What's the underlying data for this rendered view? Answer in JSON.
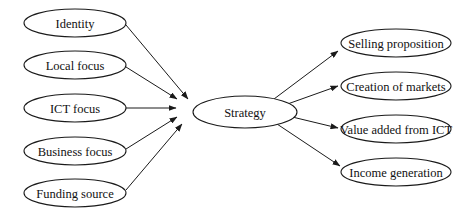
{
  "diagram": {
    "center": {
      "id": "strategy",
      "label": "Strategy",
      "cx": 245,
      "cy": 112,
      "rx": 52,
      "ry": 16
    },
    "inputs": [
      {
        "id": "identity",
        "label": "Identity",
        "cx": 75,
        "cy": 23,
        "rx": 51,
        "ry": 14
      },
      {
        "id": "local-focus",
        "label": "Local focus",
        "cx": 75,
        "cy": 65,
        "rx": 51,
        "ry": 14
      },
      {
        "id": "ict-focus",
        "label": "ICT focus",
        "cx": 75,
        "cy": 108,
        "rx": 51,
        "ry": 14
      },
      {
        "id": "business-focus",
        "label": "Business focus",
        "cx": 75,
        "cy": 151,
        "rx": 51,
        "ry": 14
      },
      {
        "id": "funding-source",
        "label": "Funding source",
        "cx": 75,
        "cy": 193,
        "rx": 51,
        "ry": 14
      }
    ],
    "outputs": [
      {
        "id": "selling-proposition",
        "label": "Selling proposition",
        "cx": 396,
        "cy": 43,
        "rx": 55,
        "ry": 14
      },
      {
        "id": "creation-of-markets",
        "label": "Creation of markets",
        "cx": 396,
        "cy": 86,
        "rx": 55,
        "ry": 14
      },
      {
        "id": "value-added-from-ict",
        "label": "Value added from ICT",
        "cx": 396,
        "cy": 129,
        "rx": 55,
        "ry": 14
      },
      {
        "id": "income-generation",
        "label": "Income generation",
        "cx": 396,
        "cy": 172,
        "rx": 55,
        "ry": 14
      }
    ],
    "edges": [
      {
        "from": "identity",
        "to": "strategy",
        "x1": 126,
        "y1": 25,
        "x2": 188,
        "y2": 99
      },
      {
        "from": "local-focus",
        "to": "strategy",
        "x1": 126,
        "y1": 67,
        "x2": 177,
        "y2": 99
      },
      {
        "from": "ict-focus",
        "to": "strategy",
        "x1": 126,
        "y1": 108,
        "x2": 176,
        "y2": 108
      },
      {
        "from": "business-focus",
        "to": "strategy",
        "x1": 126,
        "y1": 149,
        "x2": 177,
        "y2": 117
      },
      {
        "from": "funding-source",
        "to": "strategy",
        "x1": 126,
        "y1": 190,
        "x2": 182,
        "y2": 124
      },
      {
        "from": "strategy",
        "to": "selling-proposition",
        "x1": 274,
        "y1": 99,
        "x2": 338,
        "y2": 51
      },
      {
        "from": "strategy",
        "to": "creation-of-markets",
        "x1": 282,
        "y1": 106,
        "x2": 338,
        "y2": 86
      },
      {
        "from": "strategy",
        "to": "value-added-from-ict",
        "x1": 284,
        "y1": 115,
        "x2": 338,
        "y2": 128
      },
      {
        "from": "strategy",
        "to": "income-generation",
        "x1": 274,
        "y1": 122,
        "x2": 340,
        "y2": 166
      }
    ],
    "colors": {
      "stroke": "#1a1a1a",
      "fill": "#ffffff",
      "text": "#111111",
      "background": "#ffffff"
    }
  }
}
